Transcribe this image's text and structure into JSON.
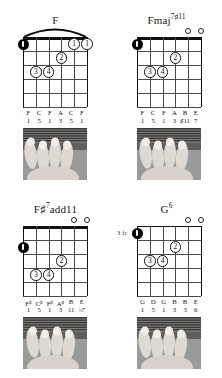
{
  "page": {
    "kind": "guitar-chord-diagram-sheet",
    "background": "#ffffff",
    "ink": "#111111"
  },
  "chords": [
    {
      "id": "chord-f",
      "title_root": "F",
      "title_sup": "",
      "title_suffix": "",
      "title_plain": "F",
      "position_label": "",
      "barre": true,
      "nut": true,
      "open_strings": [],
      "thumb": {
        "string": 6,
        "fret": 1
      },
      "fingers": [
        {
          "label": "1",
          "string": 2,
          "fret": 1
        },
        {
          "label": "1",
          "string": 1,
          "fret": 1
        },
        {
          "label": "2",
          "string": 3,
          "fret": 2
        },
        {
          "label": "3",
          "string": 5,
          "fret": 3
        },
        {
          "label": "4",
          "string": 4,
          "fret": 3
        }
      ],
      "notes": [
        "F",
        "C",
        "F",
        "A",
        "C",
        "F"
      ],
      "note_accidentals": [
        "",
        "",
        "",
        "",
        "",
        ""
      ],
      "intervals": [
        "1",
        "5",
        "1",
        "3",
        "5",
        "1"
      ]
    },
    {
      "id": "chord-fmaj7sharp11",
      "title_root": "Fmaj",
      "title_sup": "7♯11",
      "title_suffix": "",
      "title_plain": "Fmaj7#11",
      "position_label": "",
      "barre": false,
      "nut": true,
      "open_strings": [
        2,
        1
      ],
      "thumb": {
        "string": 6,
        "fret": 1
      },
      "fingers": [
        {
          "label": "2",
          "string": 3,
          "fret": 2
        },
        {
          "label": "3",
          "string": 5,
          "fret": 3
        },
        {
          "label": "4",
          "string": 4,
          "fret": 3
        }
      ],
      "notes": [
        "F",
        "C",
        "F",
        "A",
        "B",
        "E"
      ],
      "note_accidentals": [
        "",
        "",
        "",
        "",
        "",
        ""
      ],
      "intervals": [
        "1",
        "5",
        "1",
        "3",
        "♯11",
        "7"
      ]
    },
    {
      "id": "chord-fsharp7add11",
      "title_root": "F♯",
      "title_sup": "7",
      "title_suffix": "add11",
      "title_plain": "F#7add11",
      "position_label": "",
      "barre": false,
      "nut": true,
      "open_strings": [
        2,
        1
      ],
      "thumb": {
        "string": 6,
        "fret": 2
      },
      "fingers": [
        {
          "label": "2",
          "string": 3,
          "fret": 3
        },
        {
          "label": "3",
          "string": 5,
          "fret": 4
        },
        {
          "label": "4",
          "string": 4,
          "fret": 4
        }
      ],
      "notes": [
        "F",
        "C",
        "F",
        "A",
        "B",
        "E"
      ],
      "note_accidentals": [
        "♯",
        "♯",
        "♯",
        "♯",
        "",
        ""
      ],
      "intervals": [
        "1",
        "5",
        "1",
        "3",
        "11",
        "♭7"
      ]
    },
    {
      "id": "chord-g6",
      "title_root": "G",
      "title_sup": "6",
      "title_suffix": "",
      "title_plain": "G6",
      "position_label": "3 fr",
      "barre": false,
      "nut": false,
      "open_strings": [
        2,
        1
      ],
      "thumb": {
        "string": 6,
        "fret": 1
      },
      "fingers": [
        {
          "label": "2",
          "string": 3,
          "fret": 2
        },
        {
          "label": "3",
          "string": 5,
          "fret": 3
        },
        {
          "label": "4",
          "string": 4,
          "fret": 3
        }
      ],
      "notes": [
        "G",
        "D",
        "G",
        "B",
        "B",
        "E"
      ],
      "note_accidentals": [
        "",
        "",
        "",
        "",
        "",
        ""
      ],
      "intervals": [
        "1",
        "5",
        "1",
        "3",
        "3",
        "6"
      ]
    }
  ]
}
